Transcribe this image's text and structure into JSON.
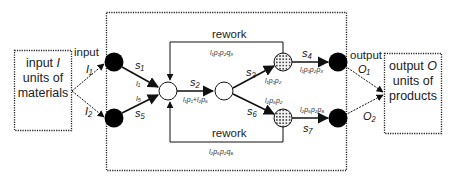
{
  "diagram": {
    "input_box": {
      "line1": "input ",
      "line1_var": "I",
      "line2": "units of",
      "line3": "materials"
    },
    "output_box": {
      "line1": "output ",
      "line1_var": "O",
      "line2": "units of",
      "line3": "products"
    },
    "input_label": "input",
    "output_label": "output",
    "edges": {
      "I1": "I₁",
      "I2": "I₂",
      "O1": "O₁",
      "O2": "O₂",
      "s1": "s₁",
      "l1": "l₁",
      "l5": "l₅",
      "s5": "s₅",
      "s2": "s₂",
      "flow_s2": "l₁p₁+l₂p₅",
      "s3": "s₃",
      "s6": "s₆",
      "s4": "s₄",
      "s7": "s₇",
      "flow_s3": "l₁p₁p₂",
      "flow_s6": "l₂p₅p₂",
      "flow_s4": "l₁p₁p₂p₃",
      "flow_s7": "l₂p₅p₂p₆"
    },
    "rework_top": {
      "label": "rework",
      "flow": "l₁p₁p₂q₃"
    },
    "rework_bottom": {
      "label": "rework",
      "flow": "l₂p₅p₂q₆"
    },
    "colors": {
      "stroke": "#111111",
      "fill_black": "#000000",
      "dotted_fill": "#f2f2f2"
    }
  }
}
